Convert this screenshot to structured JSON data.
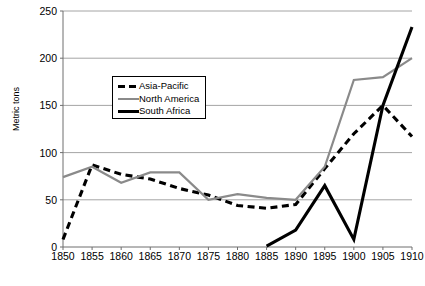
{
  "chart_data": {
    "type": "line",
    "title": "",
    "xlabel": "",
    "ylabel": "Metric tons",
    "x": [
      1850,
      1855,
      1860,
      1865,
      1870,
      1875,
      1880,
      1885,
      1890,
      1895,
      1900,
      1905,
      1910
    ],
    "xlim": [
      1850,
      1910
    ],
    "ylim": [
      0,
      250
    ],
    "yticks": [
      0,
      50,
      100,
      150,
      200,
      250
    ],
    "xticks": [
      1850,
      1855,
      1860,
      1865,
      1870,
      1875,
      1880,
      1885,
      1890,
      1895,
      1900,
      1905,
      1910
    ],
    "grid": "horizontal",
    "legend_position": "upper-left-inside",
    "series": [
      {
        "name": "Asia-Pacific",
        "style": "dashed",
        "color": "#000000",
        "x": [
          1850,
          1855,
          1860,
          1865,
          1870,
          1875,
          1880,
          1885,
          1890,
          1895,
          1900,
          1905,
          1910
        ],
        "values": [
          8,
          87,
          77,
          72,
          62,
          55,
          44,
          41,
          45,
          83,
          120,
          150,
          117
        ]
      },
      {
        "name": "North America",
        "style": "solid",
        "color": "#8a8a8a",
        "x": [
          1850,
          1855,
          1860,
          1865,
          1870,
          1875,
          1880,
          1885,
          1890,
          1895,
          1900,
          1905,
          1910
        ],
        "values": [
          74,
          85,
          68,
          79,
          79,
          50,
          56,
          52,
          50,
          85,
          177,
          180,
          200
        ]
      },
      {
        "name": "South Africa",
        "style": "solid",
        "color": "#000000",
        "x": [
          1885,
          1890,
          1895,
          1900,
          1905,
          1910
        ],
        "values": [
          1,
          18,
          65,
          8,
          150,
          233
        ]
      }
    ]
  },
  "legend": {
    "items": [
      {
        "label": "Asia-Pacific"
      },
      {
        "label": "North America"
      },
      {
        "label": "South Africa"
      }
    ]
  }
}
